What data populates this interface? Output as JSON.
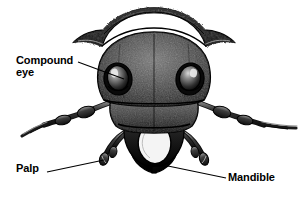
{
  "figure": {
    "style": "black-and-white stipple engraving illustration",
    "background_color": "#ffffff",
    "ink_color": "#000000"
  },
  "labels": {
    "compound_eye": {
      "text": "Compound\neye",
      "line1": "Compound",
      "line2": "eye"
    },
    "palp": {
      "text": "Palp"
    },
    "mandible": {
      "text": "Mandible"
    }
  },
  "leader_lines": [
    {
      "name": "leader-compound-eye",
      "from_x": 78,
      "from_y": 62,
      "to_x": 124,
      "to_y": 79
    },
    {
      "name": "leader-palp",
      "from_x": 47,
      "from_y": 172,
      "to_x": 104,
      "to_y": 160
    },
    {
      "name": "leader-mandible",
      "from_x": 226,
      "from_y": 178,
      "to_x": 168,
      "to_y": 166
    }
  ],
  "parts": [
    {
      "name": "pronotum",
      "label": "pronotum"
    },
    {
      "name": "head-capsule",
      "label": "head capsule"
    },
    {
      "name": "compound-eye-left",
      "label": "compound eye (left)"
    },
    {
      "name": "compound-eye-right",
      "label": "compound eye (right)"
    },
    {
      "name": "antenna-left",
      "label": "antenna (left)"
    },
    {
      "name": "antenna-right",
      "label": "antenna (right)"
    },
    {
      "name": "clypeus",
      "label": "clypeus"
    },
    {
      "name": "labrum",
      "label": "labrum"
    },
    {
      "name": "mandible-left",
      "label": "mandible (left)"
    },
    {
      "name": "mandible-right",
      "label": "mandible (right)"
    },
    {
      "name": "palp-left",
      "label": "palp (left)"
    },
    {
      "name": "palp-right",
      "label": "palp (right)"
    }
  ]
}
